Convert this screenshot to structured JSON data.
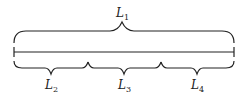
{
  "diagram": {
    "segment": {
      "x_start": 14,
      "x_end": 234,
      "y": 52
    },
    "top_brace": {
      "label_main": "L",
      "label_sub": "1",
      "x1": 14,
      "x2": 234,
      "tip_x": 122
    },
    "bottom_braces": [
      {
        "label_main": "L",
        "label_sub": "2",
        "x1": 14,
        "x2": 88,
        "tip_x": 51
      },
      {
        "label_main": "L",
        "label_sub": "3",
        "x1": 88,
        "x2": 161,
        "tip_x": 124
      },
      {
        "label_main": "L",
        "label_sub": "4",
        "x1": 161,
        "x2": 234,
        "tip_x": 197
      }
    ],
    "colors": {
      "ink": "#222222",
      "background": "#ffffff"
    }
  }
}
